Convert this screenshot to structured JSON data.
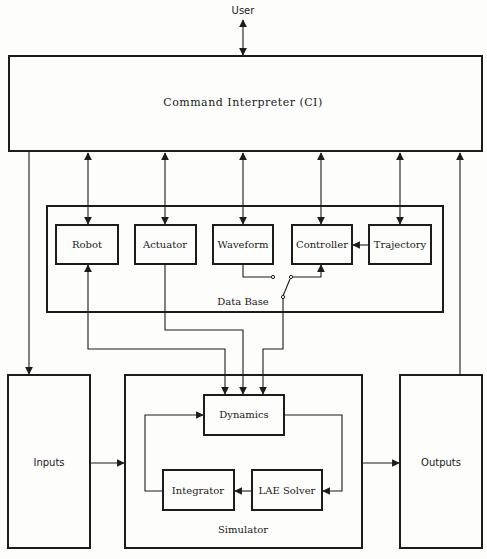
{
  "diagram": {
    "user_label": "User",
    "command_interpreter": {
      "label": "Command Interpreter (CI)"
    },
    "data_base": {
      "label": "Data Base",
      "modules": [
        {
          "id": "robot",
          "label": "Robot"
        },
        {
          "id": "actuator",
          "label": "Actuator"
        },
        {
          "id": "waveform",
          "label": "Waveform"
        },
        {
          "id": "controller",
          "label": "Controller"
        },
        {
          "id": "trajectory",
          "label": "Trajectory"
        }
      ]
    },
    "inputs": {
      "label": "Inputs"
    },
    "outputs": {
      "label": "Outputs"
    },
    "simulator": {
      "label": "Simulator",
      "blocks": [
        {
          "id": "dynamics",
          "label": "Dynamics"
        },
        {
          "id": "integrator",
          "label": "Integrator"
        },
        {
          "id": "lae_solver",
          "label": "LAE Solver"
        }
      ]
    },
    "connections": [
      {
        "from": "User",
        "to": "Command Interpreter (CI)",
        "bidirectional": true
      },
      {
        "from": "Command Interpreter (CI)",
        "to": "Robot",
        "bidirectional": true
      },
      {
        "from": "Command Interpreter (CI)",
        "to": "Actuator",
        "bidirectional": true
      },
      {
        "from": "Command Interpreter (CI)",
        "to": "Waveform",
        "bidirectional": true
      },
      {
        "from": "Command Interpreter (CI)",
        "to": "Controller",
        "bidirectional": true
      },
      {
        "from": "Command Interpreter (CI)",
        "to": "Trajectory",
        "bidirectional": true
      },
      {
        "from": "Trajectory",
        "to": "Controller"
      },
      {
        "from": "Waveform",
        "to": "Controller",
        "via": "switch"
      },
      {
        "from": "Command Interpreter (CI)",
        "to": "Inputs"
      },
      {
        "from": "Inputs",
        "to": "Simulator"
      },
      {
        "from": "Simulator",
        "to": "Outputs"
      },
      {
        "from": "Outputs",
        "to": "Command Interpreter (CI)"
      },
      {
        "from": "Robot",
        "to": "Dynamics",
        "bidirectional": true
      },
      {
        "from": "Actuator",
        "to": "Dynamics"
      },
      {
        "from": "Controller",
        "to": "Dynamics",
        "via": "switch"
      },
      {
        "from": "Dynamics",
        "to": "LAE Solver"
      },
      {
        "from": "LAE Solver",
        "to": "Integrator"
      },
      {
        "from": "Integrator",
        "to": "Dynamics"
      }
    ]
  }
}
